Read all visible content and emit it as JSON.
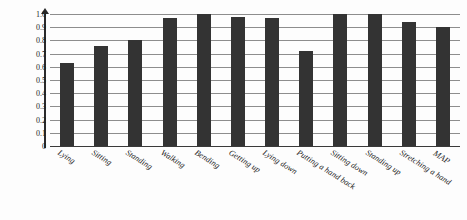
{
  "chart_data": {
    "type": "bar",
    "title": "",
    "subtitle": "",
    "xlabel": "",
    "ylabel": "(AP: Average Precision)",
    "ylim": [
      0,
      1.0
    ],
    "grid": true,
    "legend": "none",
    "bar_color": "#333333",
    "gridline_color": "#8d8d8d",
    "ytick_labels": [
      "1.0",
      "0.9",
      "0.8",
      "0.7",
      "0.6",
      "0.5",
      "0.4",
      "0.3",
      "0.2",
      "0.1",
      "0"
    ],
    "ytick_values": [
      1.0,
      0.9,
      0.8,
      0.7,
      0.6,
      0.5,
      0.4,
      0.3,
      0.2,
      0.1,
      0
    ],
    "categories": [
      "Lying",
      "Sitting",
      "Standing",
      "Walking",
      "Bending",
      "Getting up",
      "Lying down",
      "Putting a hand back",
      "Sitting down",
      "Standing up",
      "Stretching a hand",
      "MAP"
    ],
    "values": [
      0.63,
      0.76,
      0.8,
      0.97,
      1.0,
      0.98,
      0.97,
      0.72,
      1.0,
      1.0,
      0.94,
      0.9
    ]
  }
}
